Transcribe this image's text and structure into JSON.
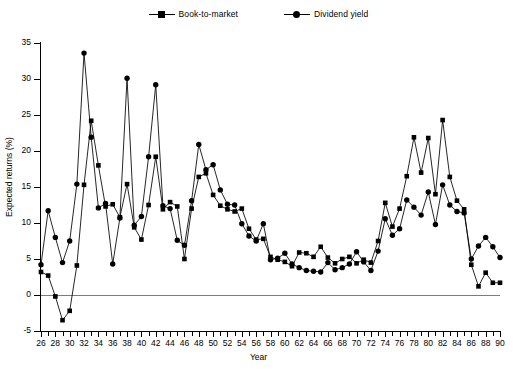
{
  "legend": {
    "entries": [
      {
        "label": "Book-to-market",
        "marker": "square-marker",
        "color": "#000000"
      },
      {
        "label": "Dividend yield",
        "marker": "circle-marker",
        "color": "#000000"
      }
    ]
  },
  "axes": {
    "y_label": "Expected returns (%)",
    "x_label": "Year",
    "y_ticks": [
      -5,
      0,
      5,
      10,
      15,
      20,
      25,
      30,
      35
    ],
    "x_ticks_major": [
      26,
      28,
      30,
      32,
      34,
      36,
      38,
      40,
      42,
      44,
      46,
      48,
      50,
      52,
      54,
      56,
      58,
      60,
      62,
      64,
      66,
      68,
      70,
      72,
      74,
      76,
      78,
      80,
      82,
      84,
      86,
      88,
      90
    ]
  },
  "chart_data": {
    "type": "line",
    "title": "",
    "xlabel": "Year",
    "ylabel": "Expected returns (%)",
    "xlim": [
      26,
      90
    ],
    "ylim": [
      -5,
      35
    ],
    "grid": false,
    "legend_position": "top-center",
    "x": [
      26,
      27,
      28,
      29,
      30,
      31,
      32,
      33,
      34,
      35,
      36,
      37,
      38,
      39,
      40,
      41,
      42,
      43,
      44,
      45,
      46,
      47,
      48,
      49,
      50,
      51,
      52,
      53,
      54,
      55,
      56,
      57,
      58,
      59,
      60,
      61,
      62,
      63,
      64,
      65,
      66,
      67,
      68,
      69,
      70,
      71,
      72,
      73,
      74,
      75,
      76,
      77,
      78,
      79,
      80,
      81,
      82,
      83,
      84,
      85,
      86,
      87,
      88,
      89,
      90
    ],
    "series": [
      {
        "name": "Book-to-market",
        "marker": "square",
        "values": [
          3.2,
          2.7,
          -0.2,
          -3.5,
          -2.2,
          4.1,
          15.3,
          24.2,
          18.0,
          12.3,
          12.6,
          10.8,
          15.4,
          9.4,
          7.7,
          12.5,
          19.2,
          11.9,
          12.9,
          12.3,
          5.0,
          12.0,
          16.4,
          16.9,
          13.9,
          12.4,
          11.9,
          11.6,
          12.0,
          9.2,
          7.7,
          7.8,
          5.3,
          4.9,
          4.6,
          4.0,
          5.9,
          5.8,
          5.3,
          6.7,
          5.2,
          4.4,
          5.0,
          5.3,
          4.4,
          4.9,
          4.5,
          7.5,
          12.8,
          9.5,
          12.0,
          16.5,
          21.9,
          17.0,
          21.8,
          14.0,
          24.3,
          16.4,
          13.1,
          11.9,
          4.2,
          1.2,
          3.1,
          1.7,
          1.7
        ]
      },
      {
        "name": "Dividend yield",
        "marker": "circle",
        "values": [
          4.2,
          11.7,
          8.0,
          4.5,
          7.5,
          15.4,
          33.6,
          21.9,
          12.1,
          12.7,
          4.3,
          10.7,
          30.1,
          9.7,
          10.9,
          19.2,
          29.2,
          12.4,
          12.0,
          7.6,
          6.9,
          13.1,
          20.9,
          17.4,
          18.1,
          14.6,
          12.6,
          12.5,
          9.9,
          8.2,
          7.5,
          9.9,
          4.9,
          5.1,
          5.8,
          4.3,
          3.8,
          3.4,
          3.3,
          3.2,
          4.5,
          3.5,
          3.8,
          4.3,
          6.0,
          4.6,
          3.4,
          6.1,
          10.6,
          8.3,
          9.2,
          13.2,
          12.2,
          11.1,
          14.3,
          9.8,
          15.3,
          12.5,
          11.6,
          11.4,
          5.0,
          6.8,
          8.0,
          6.7,
          5.2
        ]
      }
    ]
  }
}
